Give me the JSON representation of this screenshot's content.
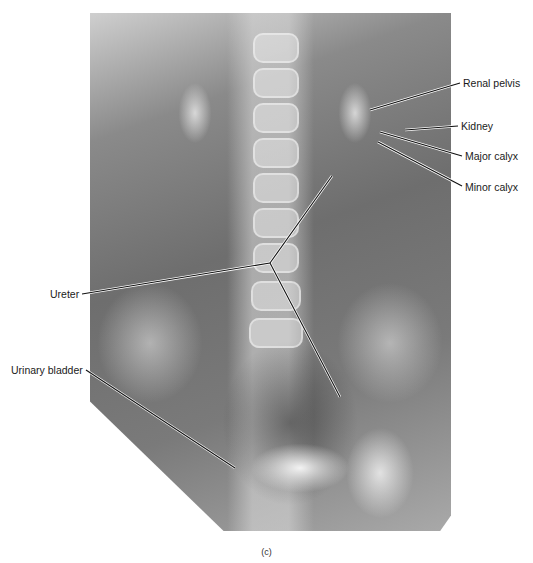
{
  "figure": {
    "image_description": "Frontal abdominal X-ray (pyelogram) showing kidneys, ureters and urinary bladder",
    "caption": "(c)",
    "labels": {
      "renal_pelvis": "Renal pelvis",
      "kidney": "Kidney",
      "major_calyx": "Major calyx",
      "minor_calyx": "Minor calyx",
      "ureter": "Ureter",
      "urinary_bladder": "Urinary bladder"
    }
  }
}
